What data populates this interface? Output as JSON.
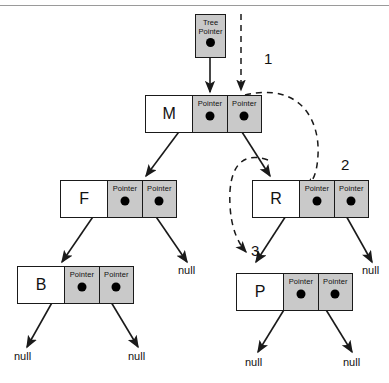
{
  "diagram": {
    "colors": {
      "pointer_cell_fill": "#c9c9c9",
      "data_cell_fill": "#ffffff",
      "border": "#1a1a1a",
      "dot": "#000000",
      "rule": "#9a9a9a",
      "line": "#1a1a1a"
    },
    "pointer_cell_label": "Pointer",
    "null_label": "null",
    "tree_pointer": {
      "line1": "Tree",
      "line2": "Pointer"
    },
    "nodes": [
      {
        "id": "m",
        "value": "M",
        "left_label": "Pointer",
        "right_label": "Pointer"
      },
      {
        "id": "f",
        "value": "F",
        "left_label": "Pointer",
        "right_label": "Pointer"
      },
      {
        "id": "r",
        "value": "R",
        "left_label": "Pointer",
        "right_label": "Pointer"
      },
      {
        "id": "b",
        "value": "B",
        "left_label": "Pointer",
        "right_label": "Pointer"
      },
      {
        "id": "p",
        "value": "P",
        "left_label": "Pointer",
        "right_label": "Pointer"
      }
    ],
    "nulls": [
      {
        "id": "null-f-right",
        "label": "null"
      },
      {
        "id": "null-r-right",
        "label": "null"
      },
      {
        "id": "null-b-left",
        "label": "null"
      },
      {
        "id": "null-b-right",
        "label": "null"
      },
      {
        "id": "null-p-left",
        "label": "null"
      },
      {
        "id": "null-p-right",
        "label": "null"
      }
    ],
    "steps": [
      {
        "id": "step-1",
        "label": "1"
      },
      {
        "id": "step-2",
        "label": "2"
      },
      {
        "id": "step-3",
        "label": "3"
      }
    ]
  }
}
